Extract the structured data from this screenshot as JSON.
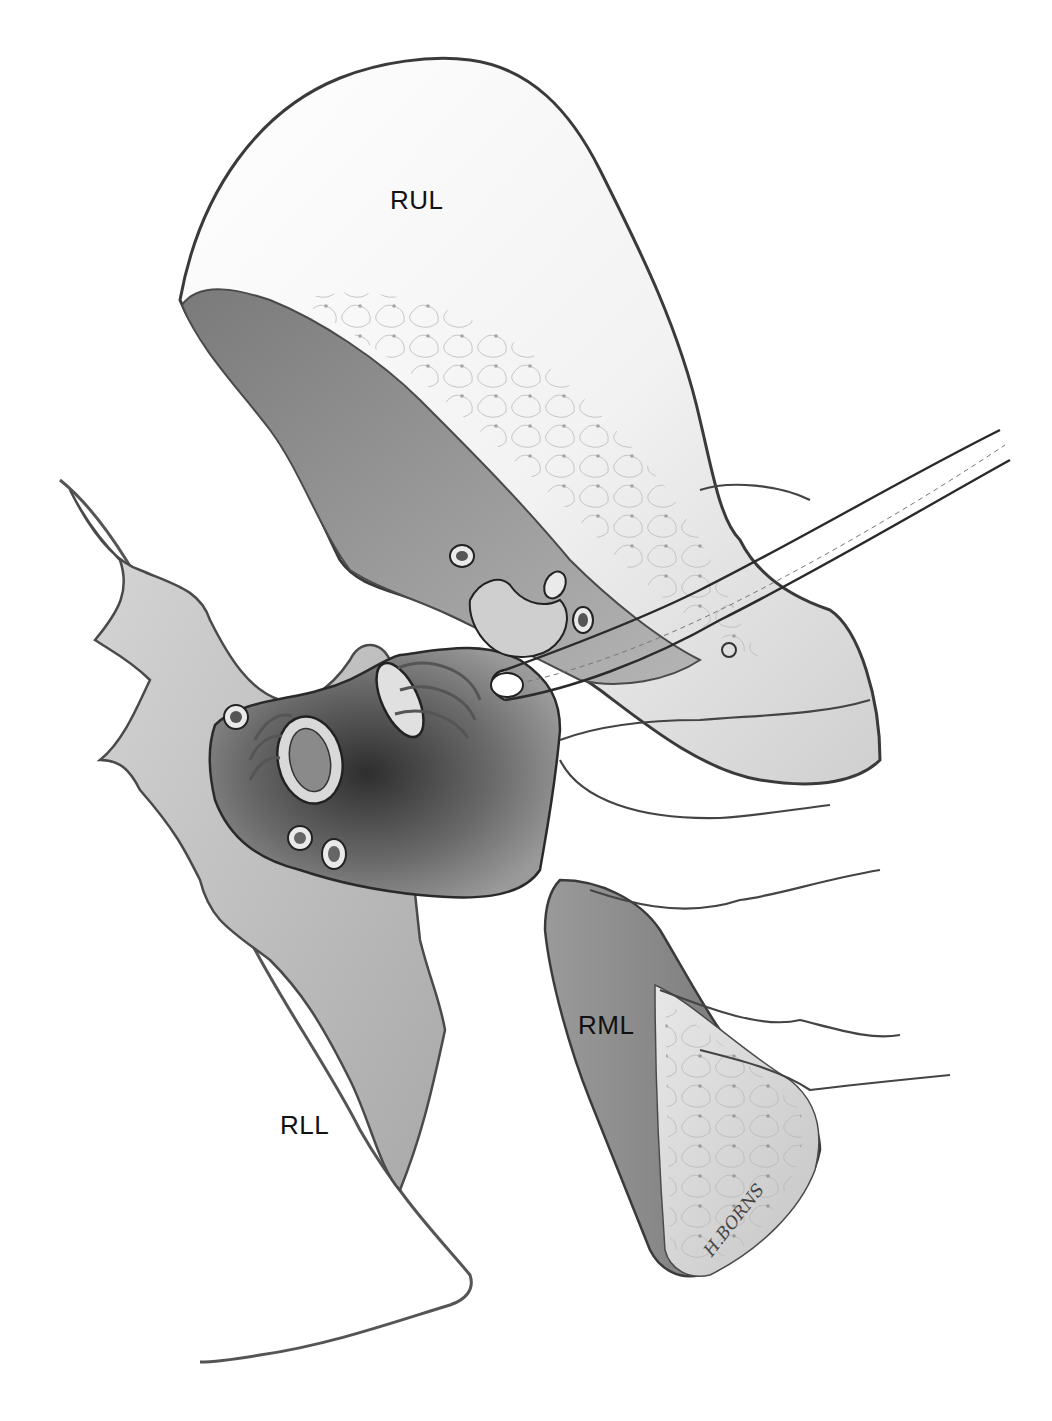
{
  "figure": {
    "type": "surgical anatomy illustration",
    "style": "grayscale",
    "labels": [
      {
        "id": "rul",
        "text": "RUL",
        "x": 390,
        "y": 185
      },
      {
        "id": "rml",
        "text": "RML",
        "x": 578,
        "y": 1010
      },
      {
        "id": "rll",
        "text": "RLL",
        "x": 280,
        "y": 1110
      }
    ],
    "signature": "H.BORNS",
    "colors": {
      "background": "#ffffff",
      "outline": "#3a3a3a",
      "lobe_light": "#eeeeee",
      "lobe_mid": "#c8c8c8",
      "lobe_dark": "#8a8a8a",
      "hilum_dark": "#4a4a4a",
      "pleura": "#bdbdbd"
    },
    "elements": [
      "upper-lobe",
      "middle-lobe",
      "lower-lobe",
      "pleural-flap",
      "hilum",
      "bronchus-stump",
      "ligated-vessels",
      "curved-scissors",
      "retracting-hand"
    ]
  }
}
